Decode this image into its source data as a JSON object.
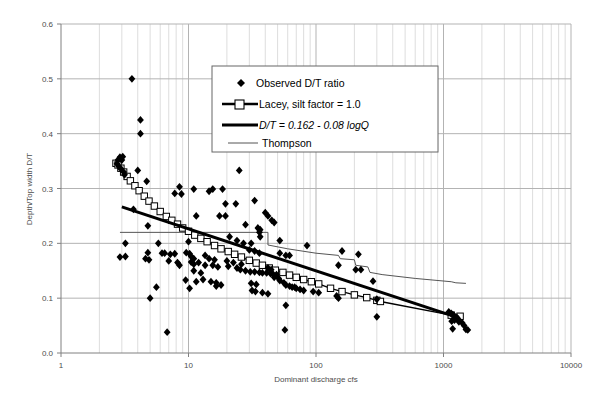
{
  "chart_data": {
    "type": "scatter",
    "title": "",
    "xlabel": "Dominant discharge cfs",
    "ylabel": "Depth/Top width D/T",
    "xscale": "log",
    "yscale": "linear",
    "xlim": [
      1,
      10000
    ],
    "ylim": [
      0.0,
      0.6
    ],
    "xticks": [
      1,
      10,
      100,
      1000,
      10000
    ],
    "xtick_labels": [
      "1",
      "10",
      "100",
      "1000",
      "10000"
    ],
    "yticks": [
      0.0,
      0.1,
      0.2,
      0.3,
      0.4,
      0.5,
      0.6
    ],
    "ytick_labels": [
      "0.0",
      "0.1",
      "0.2",
      "0.3",
      "0.4",
      "0.5",
      "0.6"
    ],
    "grid": "minor vertical log gridlines, major horizontal gridlines",
    "legend_position": "upper center",
    "legend": [
      {
        "label": "Observed D/T ratio",
        "marker": "diamond",
        "style": "italic-no"
      },
      {
        "label": "Lacey, silt factor = 1.0",
        "marker": "square-line",
        "style": "italic-no"
      },
      {
        "label": "D/T = 0.162  -  0.08  logQ",
        "marker": "thick-line",
        "style": "italic-yes"
      },
      {
        "label": "Thompson",
        "marker": "thin-line",
        "style": "italic-no"
      }
    ],
    "series": [
      {
        "name": "Observed D/T ratio",
        "type": "scatter",
        "marker": "diamond",
        "color": "#000000",
        "points": [
          [
            3.6,
            0.5
          ],
          [
            4.2,
            0.425
          ],
          [
            4.2,
            0.4
          ],
          [
            2.75,
            0.345
          ],
          [
            2.8,
            0.352
          ],
          [
            2.9,
            0.357
          ],
          [
            3.05,
            0.358
          ],
          [
            3.0,
            0.352
          ],
          [
            2.85,
            0.34
          ],
          [
            2.95,
            0.336
          ],
          [
            3.1,
            0.33
          ],
          [
            3.15,
            0.325
          ],
          [
            4.0,
            0.333
          ],
          [
            4.7,
            0.313
          ],
          [
            25.0,
            0.333
          ],
          [
            8.5,
            0.303
          ],
          [
            11.0,
            0.299
          ],
          [
            15.5,
            0.299
          ],
          [
            18.5,
            0.299
          ],
          [
            14.5,
            0.295
          ],
          [
            7.8,
            0.291
          ],
          [
            8.8,
            0.29
          ],
          [
            19.5,
            0.272
          ],
          [
            23.5,
            0.272
          ],
          [
            33.0,
            0.278
          ],
          [
            3.7,
            0.262
          ],
          [
            11.5,
            0.25
          ],
          [
            17.5,
            0.25
          ],
          [
            19.5,
            0.25
          ],
          [
            40.0,
            0.256
          ],
          [
            42.0,
            0.25
          ],
          [
            45.0,
            0.242
          ],
          [
            47.0,
            0.238
          ],
          [
            4.8,
            0.232
          ],
          [
            28.0,
            0.234
          ],
          [
            35.0,
            0.228
          ],
          [
            36.5,
            0.225
          ],
          [
            36.0,
            0.22
          ],
          [
            36.5,
            0.212
          ],
          [
            52.0,
            0.205
          ],
          [
            21.0,
            0.212
          ],
          [
            24.0,
            0.205
          ],
          [
            3.2,
            0.2
          ],
          [
            5.8,
            0.2
          ],
          [
            10.0,
            0.203
          ],
          [
            27.0,
            0.2
          ],
          [
            31.0,
            0.2
          ],
          [
            85.0,
            0.196
          ],
          [
            2.9,
            0.175
          ],
          [
            3.2,
            0.176
          ],
          [
            4.8,
            0.183
          ],
          [
            4.6,
            0.172
          ],
          [
            4.9,
            0.17
          ],
          [
            6.5,
            0.182
          ],
          [
            7.2,
            0.18
          ],
          [
            7.8,
            0.181
          ],
          [
            9.6,
            0.183
          ],
          [
            10.2,
            0.181
          ],
          [
            10.5,
            0.176
          ],
          [
            11.0,
            0.172
          ],
          [
            13.5,
            0.178
          ],
          [
            14.5,
            0.172
          ],
          [
            16.0,
            0.17
          ],
          [
            30.0,
            0.188
          ],
          [
            33.0,
            0.186
          ],
          [
            36.0,
            0.182
          ],
          [
            52.0,
            0.182
          ],
          [
            58.0,
            0.178
          ],
          [
            62.0,
            0.178
          ],
          [
            160.0,
            0.186
          ],
          [
            215.0,
            0.18
          ],
          [
            150.0,
            0.16
          ],
          [
            205.0,
            0.152
          ],
          [
            225.0,
            0.152
          ],
          [
            8.5,
            0.16
          ],
          [
            10.5,
            0.166
          ],
          [
            11.0,
            0.162
          ],
          [
            12.0,
            0.165
          ],
          [
            13.5,
            0.16
          ],
          [
            15.5,
            0.16
          ],
          [
            17.0,
            0.157
          ],
          [
            20.5,
            0.158
          ],
          [
            24.0,
            0.155
          ],
          [
            25.5,
            0.152
          ],
          [
            28.0,
            0.15
          ],
          [
            30.5,
            0.148
          ],
          [
            33.0,
            0.148
          ],
          [
            36.0,
            0.147
          ],
          [
            38.0,
            0.146
          ],
          [
            41.0,
            0.146
          ],
          [
            44.0,
            0.145
          ],
          [
            46.0,
            0.144
          ],
          [
            49.0,
            0.143
          ],
          [
            42.0,
            0.155
          ],
          [
            44.5,
            0.152
          ],
          [
            11.0,
            0.15
          ],
          [
            12.5,
            0.146
          ],
          [
            9.5,
            0.133
          ],
          [
            11.5,
            0.13
          ],
          [
            13.0,
            0.134
          ],
          [
            15.0,
            0.13
          ],
          [
            16.5,
            0.128
          ],
          [
            18.0,
            0.124
          ],
          [
            31.0,
            0.127
          ],
          [
            34.0,
            0.125
          ],
          [
            52.0,
            0.132
          ],
          [
            56.0,
            0.128
          ],
          [
            58.0,
            0.124
          ],
          [
            62.0,
            0.122
          ],
          [
            65.0,
            0.12
          ],
          [
            68.0,
            0.12
          ],
          [
            280.0,
            0.131
          ],
          [
            5.0,
            0.1
          ],
          [
            6.8,
            0.038
          ],
          [
            5.6,
            0.12
          ],
          [
            10.2,
            0.118
          ],
          [
            16.5,
            0.122
          ],
          [
            31.5,
            0.114
          ],
          [
            33.5,
            0.112
          ],
          [
            38.0,
            0.11
          ],
          [
            42.0,
            0.108
          ],
          [
            145.0,
            0.104
          ],
          [
            150.0,
            0.1
          ],
          [
            300.0,
            0.098
          ],
          [
            58.0,
            0.087
          ],
          [
            57.0,
            0.042
          ],
          [
            1100.0,
            0.075
          ],
          [
            1150.0,
            0.072
          ],
          [
            1180.0,
            0.07
          ],
          [
            1200.0,
            0.068
          ],
          [
            1250.0,
            0.066
          ],
          [
            1280.0,
            0.064
          ],
          [
            1300.0,
            0.062
          ],
          [
            1220.0,
            0.06
          ],
          [
            1160.0,
            0.058
          ],
          [
            1320.0,
            0.057
          ],
          [
            1400.0,
            0.055
          ],
          [
            1450.0,
            0.05
          ],
          [
            1180.0,
            0.044
          ],
          [
            1500.0,
            0.043
          ],
          [
            1550.0,
            0.042
          ],
          [
            300.0,
            0.066
          ],
          [
            6.2,
            0.182
          ],
          [
            7.0,
            0.168
          ],
          [
            8.2,
            0.165
          ],
          [
            20.0,
            0.168
          ],
          [
            22.5,
            0.165
          ],
          [
            26.0,
            0.162
          ],
          [
            47.0,
            0.138
          ],
          [
            51.0,
            0.136
          ],
          [
            70.0,
            0.118
          ],
          [
            75.0,
            0.116
          ],
          [
            80.0,
            0.114
          ],
          [
            95.0,
            0.112
          ],
          [
            105.0,
            0.11
          ]
        ]
      },
      {
        "name": "Lacey, silt factor = 1.0",
        "type": "line-markers",
        "marker": "open-square",
        "color": "#000000",
        "points": [
          [
            2.7,
            0.346
          ],
          [
            2.8,
            0.343
          ],
          [
            2.95,
            0.337
          ],
          [
            3.1,
            0.33
          ],
          [
            3.3,
            0.322
          ],
          [
            3.5,
            0.314
          ],
          [
            3.8,
            0.305
          ],
          [
            4.1,
            0.296
          ],
          [
            4.5,
            0.286
          ],
          [
            4.9,
            0.277
          ],
          [
            5.4,
            0.268
          ],
          [
            6.0,
            0.258
          ],
          [
            6.7,
            0.249
          ],
          [
            7.4,
            0.242
          ],
          [
            8.2,
            0.235
          ],
          [
            9.0,
            0.228
          ],
          [
            10.0,
            0.222
          ],
          [
            11.2,
            0.215
          ],
          [
            12.5,
            0.209
          ],
          [
            14.0,
            0.203
          ],
          [
            16.0,
            0.196
          ],
          [
            18.0,
            0.19
          ],
          [
            20.5,
            0.185
          ],
          [
            23.0,
            0.18
          ],
          [
            26.0,
            0.175
          ],
          [
            30.0,
            0.169
          ],
          [
            34.0,
            0.164
          ],
          [
            38.0,
            0.16
          ],
          [
            43.0,
            0.155
          ],
          [
            48.0,
            0.151
          ],
          [
            55.0,
            0.147
          ],
          [
            62.0,
            0.142
          ],
          [
            70.0,
            0.138
          ],
          [
            80.0,
            0.134
          ],
          [
            92.0,
            0.13
          ],
          [
            105.0,
            0.126
          ],
          [
            130.0,
            0.118
          ],
          [
            160.0,
            0.112
          ],
          [
            200.0,
            0.106
          ],
          [
            250.0,
            0.101
          ],
          [
            300.0,
            0.096
          ],
          [
            320.0,
            0.094
          ],
          [
            1150.0,
            0.069
          ],
          [
            1350.0,
            0.067
          ]
        ]
      },
      {
        "name": "D/T = 0.162 - 0.08 logQ",
        "type": "line",
        "equation": "D/T = 0.162 - 0.08 logQ",
        "intercept": 0.162,
        "slope": -0.08,
        "color": "#000000",
        "points": [
          [
            3.0,
            0.2665
          ],
          [
            1300.0,
            0.0645
          ]
        ]
      },
      {
        "name": "Thompson",
        "type": "step-line",
        "color": "#555555",
        "points": [
          [
            2.9,
            0.22
          ],
          [
            42.0,
            0.22
          ],
          [
            42.0,
            0.197
          ],
          [
            60.0,
            0.19
          ],
          [
            100.0,
            0.182
          ],
          [
            150.0,
            0.178
          ],
          [
            155.0,
            0.172
          ],
          [
            200.0,
            0.17
          ],
          [
            205.0,
            0.16
          ],
          [
            255.0,
            0.157
          ],
          [
            265.0,
            0.147
          ],
          [
            330.0,
            0.143
          ],
          [
            600.0,
            0.136
          ],
          [
            1150.0,
            0.13
          ],
          [
            1250.0,
            0.128
          ],
          [
            1500.0,
            0.127
          ]
        ]
      }
    ]
  },
  "axes": {
    "x_title": "Dominant discharge cfs",
    "y_title": "Depth/Top width D/T"
  },
  "colors": {
    "axis": "#808080",
    "gridline_major": "#b3b3b3",
    "gridline_minor": "#dddddd",
    "data": "#000000",
    "thompson": "#555555",
    "text": "#4d4d4d",
    "plot_background": "#ffffff"
  }
}
